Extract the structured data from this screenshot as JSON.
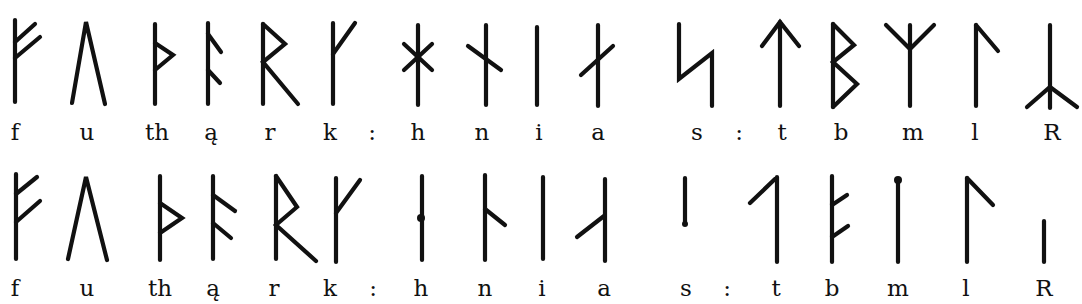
{
  "diagram": {
    "title": "",
    "rows": [
      {
        "name": "elder-futhark",
        "labels": [
          "f",
          "u",
          "th",
          "ą",
          "r",
          "k",
          ":",
          "h",
          "n",
          "i",
          "a",
          "s",
          ":",
          "t",
          "b",
          "m",
          "l",
          "R"
        ]
      },
      {
        "name": "younger-futhark-short-twig",
        "labels": [
          "f",
          "u",
          "th",
          "ą",
          "r",
          "k",
          ":",
          "h",
          "n",
          "i",
          "a",
          "s",
          ":",
          "t",
          "b",
          "m",
          "l",
          "R"
        ]
      }
    ]
  }
}
